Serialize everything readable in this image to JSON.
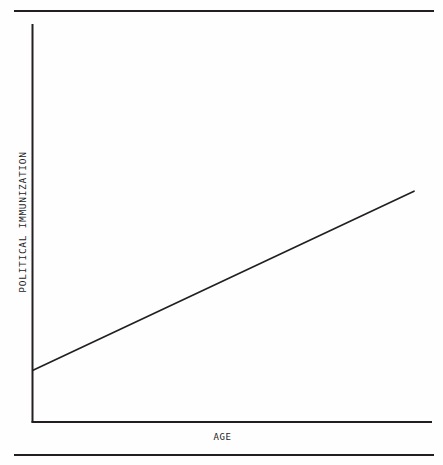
{
  "figure": {
    "rules": {
      "top_label": "page-rule-top",
      "bottom_label": "page-rule-bottom"
    }
  },
  "chart_data": {
    "type": "line",
    "title": "",
    "subtitle": "",
    "xlabel": "AGE",
    "ylabel": "POLITICAL IMMUNIZATION",
    "x": [
      0,
      100
    ],
    "series": [
      {
        "name": "political immunization by age",
        "values": [
          13,
          58
        ]
      }
    ],
    "xlim": [
      0,
      100
    ],
    "ylim": [
      0,
      100
    ],
    "xticks": [],
    "yticks": [],
    "xticklabels": [],
    "yticklabels": [],
    "grid": false,
    "legend": false,
    "legend_position": "none",
    "annotations": [],
    "axis_color": "#231f20",
    "line_color": "#231f20",
    "background_color": "#fefefe"
  }
}
